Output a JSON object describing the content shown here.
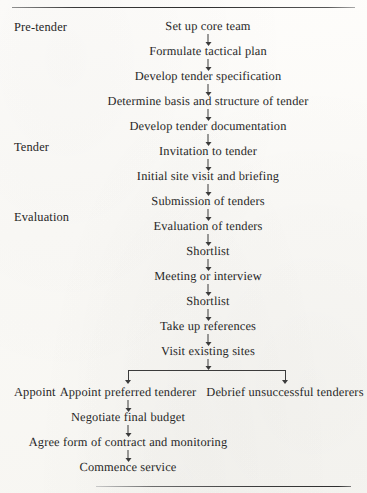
{
  "document": {
    "type": "flowchart",
    "title": "Tendering process flow chart",
    "top_rule": "horizontal-rule",
    "bottom_rule": "horizontal-rule"
  },
  "stages": [
    {
      "label": "Pre-tender"
    },
    {
      "label": "Tender"
    },
    {
      "label": "Evaluation"
    },
    {
      "label": "Appoint"
    }
  ],
  "main_flow": [
    {
      "label": "Set up core team"
    },
    {
      "label": "Formulate tactical plan"
    },
    {
      "label": "Develop tender specification"
    },
    {
      "label": "Determine basis and structure of tender"
    },
    {
      "label": "Develop tender documentation"
    },
    {
      "label": "Invitation to tender"
    },
    {
      "label": "Initial site visit and briefing"
    },
    {
      "label": "Submission of tenders"
    },
    {
      "label": "Evaluation of tenders"
    },
    {
      "label": "Shortlist"
    },
    {
      "label": "Meeting or interview"
    },
    {
      "label": "Shortlist"
    },
    {
      "label": "Take up references"
    },
    {
      "label": "Visit existing sites"
    }
  ],
  "branch": {
    "left_label": "Appoint preferred tenderer",
    "right_label": "Debrief unsuccessful tenderers"
  },
  "appoint_flow": [
    {
      "label": "Negotiate final budget"
    },
    {
      "label": "Agree form of contract and monitoring"
    },
    {
      "label": "Commence service"
    }
  ],
  "colors": {
    "ink": "#262626",
    "rule": "#2e2e2e",
    "arrow": "#3b3b3b",
    "paper": "#fcfbf8"
  }
}
